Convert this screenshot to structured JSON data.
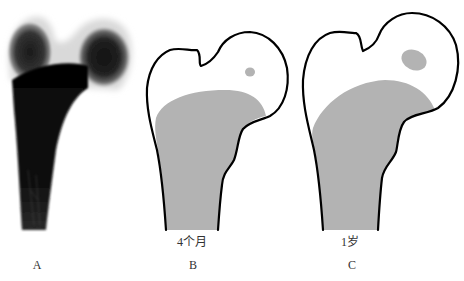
{
  "figure": {
    "panels": [
      {
        "id": "A",
        "letter": "A",
        "caption": "",
        "kind": "radiograph",
        "description": "Proximal femur X-ray showing femoral head and greater trochanter ossification"
      },
      {
        "id": "B",
        "letter": "B",
        "caption": "4个月",
        "kind": "schematic",
        "description": "Proximal femur outline at 4 months with small ossification center in femoral head"
      },
      {
        "id": "C",
        "letter": "C",
        "caption": "1岁",
        "kind": "schematic",
        "description": "Proximal femur outline at 1 year with enlarged ossification center in femoral head"
      }
    ],
    "colors": {
      "bone_fill": "#b3b3b3",
      "outline": "#000000",
      "background": "#ffffff",
      "xray_dark": "#0a0a0a"
    }
  }
}
